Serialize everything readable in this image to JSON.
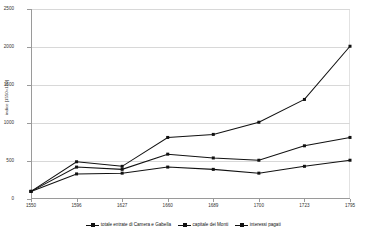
{
  "title_sliver": "",
  "chart_data": {
    "type": "line",
    "title": "",
    "xlabel": "",
    "ylabel": "indice [1550=100]",
    "categories": [
      "1550",
      "1596",
      "1627",
      "1660",
      "1689",
      "1700",
      "1723",
      "1795"
    ],
    "ylim": [
      0,
      2500
    ],
    "ytick_labels": [
      "0",
      "500",
      "1000",
      "1500",
      "2000",
      "2500"
    ],
    "ytick_values": [
      0,
      500,
      1000,
      1500,
      2000,
      2500
    ],
    "grid": true,
    "legend_position": "bottom",
    "series": [
      {
        "name": "totale entrate di Camera e Gabella",
        "values": [
          100,
          490,
          430,
          810,
          850,
          1010,
          1310,
          2010
        ],
        "color": "#111111",
        "marker": "square"
      },
      {
        "name": "capitale dei Monti",
        "values": [
          100,
          420,
          390,
          590,
          540,
          510,
          700,
          810
        ],
        "color": "#111111",
        "marker": "square"
      },
      {
        "name": "interessi pagati",
        "values": [
          100,
          330,
          340,
          420,
          390,
          340,
          430,
          510
        ],
        "color": "#111111",
        "marker": "square"
      }
    ]
  }
}
